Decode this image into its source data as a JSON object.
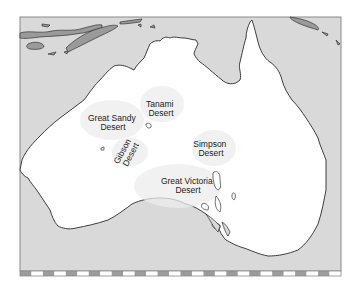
{
  "map": {
    "title": "Deserts of Australia",
    "colors": {
      "ocean": "#d9d9d9",
      "land": "#ffffff",
      "coastline": "#2a2a2a",
      "islands": "#9a9a9a",
      "desert_stipple": "#e6e6e6",
      "frame": "#8a8a8a",
      "scale_dark": "#9c9c9c",
      "scale_light": "#ffffff"
    },
    "deserts": [
      {
        "name": "great-sandy",
        "line1": "Great Sandy",
        "line2": "Desert"
      },
      {
        "name": "tanami",
        "line1": "Tanami",
        "line2": "Desert"
      },
      {
        "name": "gibson",
        "line1": "Gibson",
        "line2": "Desert"
      },
      {
        "name": "simpson",
        "line1": "Simpson",
        "line2": "Desert"
      },
      {
        "name": "great-victoria",
        "line1": "Great Victoria",
        "line2": "Desert"
      }
    ],
    "scale_bar": {
      "segments": 28
    }
  }
}
